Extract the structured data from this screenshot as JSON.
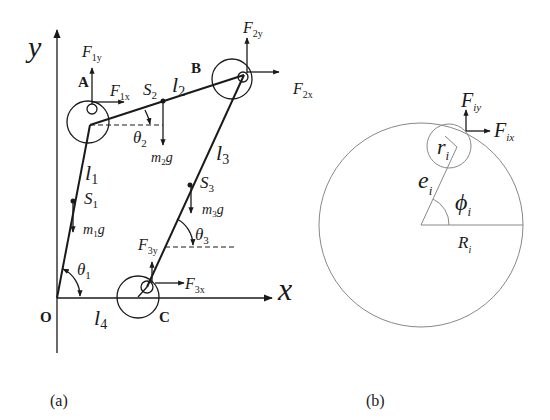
{
  "figure_a": {
    "caption": "(a)",
    "axes": {
      "x_label": "x",
      "y_label": "y"
    },
    "points": {
      "A": "A",
      "B": "B",
      "C": "C",
      "O": "O"
    },
    "links": {
      "l1": "l",
      "l1_sub": "1",
      "l2": "l",
      "l2_sub": "2",
      "l3": "l",
      "l3_sub": "3",
      "l4": "l",
      "l4_sub": "4"
    },
    "centers_of_mass": {
      "S1": "S",
      "S1_sub": "1",
      "S2": "S",
      "S2_sub": "2",
      "S3": "S",
      "S3_sub": "3"
    },
    "weights": {
      "m1g_m": "m",
      "m1g_sub": "1",
      "m1g_g": "g",
      "m2g_m": "m",
      "m2g_sub": "2",
      "m2g_g": "g",
      "m3g_m": "m",
      "m3g_sub": "3",
      "m3g_g": "g"
    },
    "angles": {
      "theta": "θ",
      "theta1_sub": "1",
      "theta2_sub": "2",
      "theta3_sub": "3"
    },
    "forces": {
      "F": "F",
      "F1x_sub": "1x",
      "F1y_sub": "1y",
      "F2x_sub": "2x",
      "F2y_sub": "2y",
      "F3x_sub": "3x",
      "F3y_sub": "3y"
    }
  },
  "figure_b": {
    "caption": "(b)",
    "F": "F",
    "Fix_sub": "ix",
    "Fiy_sub": "iy",
    "r": "r",
    "r_sub": "i",
    "e": "e",
    "e_sub": "i",
    "phi": "ϕ",
    "phi_sub": "i",
    "R": "R",
    "R_sub": "i"
  }
}
